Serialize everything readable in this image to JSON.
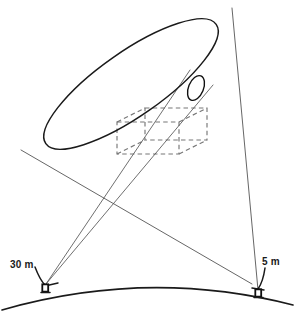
{
  "figure": {
    "width": 295,
    "height": 316,
    "background_color": "#ffffff",
    "ink_color": "#1a1a1a"
  },
  "labels": {
    "left_antenna": "30 m",
    "right_antenna": "5 m"
  },
  "elements": {
    "dish_name": "parabolic dish aperture ellipse",
    "feed_name": "feed horn ellipse",
    "box_name": "dashed wireframe reference box",
    "ground_name": "curved earth surface",
    "left_antenna_name": "30 m ground antenna",
    "right_antenna_name": "5 m ground antenna"
  },
  "geometry": {
    "dish_ellipse": {
      "cx": 131,
      "cy": 84,
      "rx": 104,
      "ry": 32,
      "rotation_deg": -35
    },
    "feed_ellipse": {
      "cx": 196,
      "cy": 88,
      "rx": 7.5,
      "ry": 13,
      "rotation_deg": 22
    },
    "left_antenna": {
      "x": 45,
      "y": 287
    },
    "right_antenna": {
      "x": 258,
      "y": 292
    },
    "dashed_box": {
      "front": {
        "x": 117,
        "y": 122,
        "w": 62,
        "h": 32
      },
      "offset": {
        "dx": 28,
        "dy": -14
      }
    },
    "ground_arc": {
      "start": {
        "x": 2,
        "y": 310
      },
      "control": {
        "x": 148,
        "y": 272
      },
      "end": {
        "x": 293,
        "y": 305
      }
    },
    "long_line_top": {
      "x": 232,
      "y": 8
    },
    "long_line_bottom": {
      "x": 258,
      "y": 290
    },
    "cross_line_start": {
      "x": 21,
      "y": 150
    },
    "cross_line_end": {
      "x": 252,
      "y": 284
    },
    "ray_a": {
      "from": {
        "x": 46,
        "y": 284
      },
      "to": {
        "x": 211,
        "y": 83
      }
    },
    "ray_b": {
      "from": {
        "x": 46,
        "y": 284
      },
      "to": {
        "x": 190,
        "y": 72
      }
    }
  }
}
